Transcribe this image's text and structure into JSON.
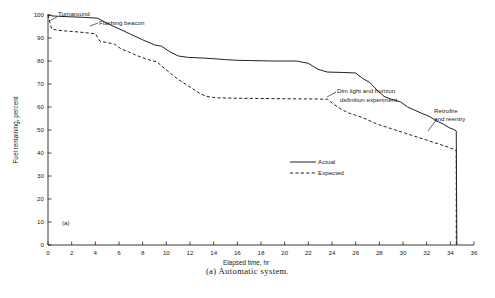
{
  "figure": {
    "caption": "(a)  Automatic system.",
    "panel_label": "(a)"
  },
  "chart_data": {
    "type": "line",
    "title": "",
    "subtitle": "",
    "xlabel": "Elapsed time, hr",
    "ylabel": "Fuel remaining, percent",
    "xlim": [
      0,
      36
    ],
    "ylim": [
      0,
      100
    ],
    "xticks": [
      0,
      2,
      4,
      6,
      8,
      10,
      12,
      14,
      16,
      18,
      20,
      22,
      24,
      26,
      28,
      30,
      32,
      34,
      36
    ],
    "yticks": [
      0,
      10,
      20,
      30,
      40,
      50,
      60,
      70,
      80,
      90,
      100
    ],
    "xtick_labels": [
      "0",
      "2",
      "4",
      "6",
      "8",
      "10",
      "12",
      "14",
      "16",
      "18",
      "20",
      "22",
      "24",
      "26",
      "28",
      "30",
      "32",
      "34",
      "36"
    ],
    "ytick_labels": [
      "0",
      "10",
      "20",
      "30",
      "40",
      "50",
      "60",
      "70",
      "80",
      "90",
      "100"
    ],
    "grid": false,
    "legend_position": "center-right",
    "series": [
      {
        "name": "Actual",
        "style": "solid",
        "color": "#222222",
        "points": [
          [
            0.0,
            100.0
          ],
          [
            0.35,
            99.6
          ],
          [
            1.0,
            99.4
          ],
          [
            2.0,
            99.2
          ],
          [
            3.0,
            99.0
          ],
          [
            4.2,
            98.6
          ],
          [
            5.0,
            96.4
          ],
          [
            6.0,
            94.0
          ],
          [
            7.0,
            91.6
          ],
          [
            8.0,
            89.2
          ],
          [
            9.0,
            87.0
          ],
          [
            9.6,
            86.4
          ],
          [
            10.3,
            84.0
          ],
          [
            11.0,
            82.2
          ],
          [
            11.8,
            81.6
          ],
          [
            13.0,
            81.3
          ],
          [
            14.0,
            81.0
          ],
          [
            15.0,
            80.6
          ],
          [
            16.0,
            80.3
          ],
          [
            17.0,
            80.2
          ],
          [
            18.0,
            80.1
          ],
          [
            19.0,
            80.0
          ],
          [
            20.0,
            80.0
          ],
          [
            21.0,
            80.0
          ],
          [
            22.0,
            79.0
          ],
          [
            22.8,
            76.4
          ],
          [
            23.6,
            75.2
          ],
          [
            25.0,
            75.0
          ],
          [
            26.0,
            74.8
          ],
          [
            26.6,
            72.4
          ],
          [
            27.2,
            70.6
          ],
          [
            27.8,
            67.4
          ],
          [
            28.4,
            64.6
          ],
          [
            29.0,
            63.4
          ],
          [
            29.8,
            62.2
          ],
          [
            30.4,
            60.0
          ],
          [
            31.0,
            58.6
          ],
          [
            31.6,
            57.2
          ],
          [
            32.2,
            56.0
          ],
          [
            32.8,
            54.0
          ],
          [
            33.4,
            52.6
          ],
          [
            33.9,
            51.0
          ],
          [
            34.3,
            50.2
          ],
          [
            34.5,
            49.6
          ],
          [
            34.55,
            0.0
          ]
        ]
      },
      {
        "name": "Expected",
        "style": "dashed",
        "color": "#222222",
        "points": [
          [
            0.0,
            100.0
          ],
          [
            0.3,
            94.0
          ],
          [
            0.8,
            93.4
          ],
          [
            1.6,
            93.0
          ],
          [
            2.6,
            92.6
          ],
          [
            3.4,
            92.2
          ],
          [
            4.0,
            91.8
          ],
          [
            4.4,
            88.6
          ],
          [
            5.0,
            88.0
          ],
          [
            5.6,
            87.4
          ],
          [
            6.2,
            85.2
          ],
          [
            6.8,
            84.0
          ],
          [
            7.4,
            82.6
          ],
          [
            8.0,
            81.4
          ],
          [
            8.6,
            80.4
          ],
          [
            9.2,
            79.6
          ],
          [
            9.8,
            77.0
          ],
          [
            10.4,
            74.4
          ],
          [
            11.0,
            72.0
          ],
          [
            11.6,
            70.0
          ],
          [
            12.2,
            68.0
          ],
          [
            12.8,
            66.0
          ],
          [
            13.4,
            64.6
          ],
          [
            14.2,
            64.0
          ],
          [
            16.0,
            63.8
          ],
          [
            18.0,
            63.7
          ],
          [
            20.0,
            63.6
          ],
          [
            22.0,
            63.5
          ],
          [
            23.6,
            63.4
          ],
          [
            24.2,
            61.0
          ],
          [
            24.8,
            59.0
          ],
          [
            25.4,
            57.4
          ],
          [
            26.0,
            56.4
          ],
          [
            26.6,
            55.4
          ],
          [
            27.2,
            54.0
          ],
          [
            27.8,
            52.6
          ],
          [
            28.4,
            51.6
          ],
          [
            29.0,
            50.6
          ],
          [
            29.6,
            49.6
          ],
          [
            30.2,
            48.6
          ],
          [
            30.8,
            47.6
          ],
          [
            31.4,
            46.6
          ],
          [
            32.0,
            45.6
          ],
          [
            32.6,
            44.6
          ],
          [
            33.2,
            43.6
          ],
          [
            33.8,
            42.6
          ],
          [
            34.3,
            41.6
          ],
          [
            34.5,
            41.0
          ],
          [
            34.5,
            0.0
          ]
        ]
      }
    ],
    "annotations": [
      {
        "id": "turnaround",
        "text": "Turnaround",
        "text_x": 58,
        "text_y": 16,
        "leader": "M 57 17 L 49 21"
      },
      {
        "id": "flashing-beacon",
        "text": "Flashing beacon",
        "text_x": 99,
        "text_y": 25,
        "leader": "M 98 23 L 90 26"
      },
      {
        "id": "dim-light-horizon-1",
        "text": "Dim light and horizon",
        "text_x": 337,
        "text_y": 93,
        "leader": "M 336 92 L 327 97"
      },
      {
        "id": "dim-light-horizon-2",
        "text": "definition experiment",
        "text_x": 340,
        "text_y": 102,
        "leader": ""
      },
      {
        "id": "retrofire-1",
        "text": "Retrofire",
        "text_x": 434,
        "text_y": 113,
        "leader": "M 437 119 L 428 131"
      },
      {
        "id": "retrofire-2",
        "text": "and reentry",
        "text_x": 434,
        "text_y": 121,
        "leader": ""
      }
    ],
    "legend": [
      {
        "label": "Actual",
        "style": "solid"
      },
      {
        "label": "Expected",
        "style": "dashed"
      }
    ]
  }
}
